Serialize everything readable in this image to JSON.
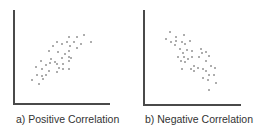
{
  "chart_data": [
    {
      "type": "scatter",
      "title": "a) Positive Correlation",
      "xlabel": "",
      "ylabel": "",
      "grid": false,
      "legend": "none",
      "note": "pixel coordinates within panel (x right, y down); no axis ticks or labels shown",
      "axes": {
        "origin": [
          14,
          104
        ],
        "y_top": 10,
        "x_end": 110
      },
      "points": [
        [
          69,
          37
        ],
        [
          77,
          37
        ],
        [
          84,
          35
        ],
        [
          57,
          42
        ],
        [
          62,
          44
        ],
        [
          67,
          42
        ],
        [
          74,
          42
        ],
        [
          81,
          44
        ],
        [
          91,
          42
        ],
        [
          53,
          46
        ],
        [
          70,
          46
        ],
        [
          77,
          48
        ],
        [
          49,
          51
        ],
        [
          58,
          52
        ],
        [
          69,
          51
        ],
        [
          65,
          54
        ],
        [
          69,
          57
        ],
        [
          71,
          58
        ],
        [
          41,
          61
        ],
        [
          51,
          59
        ],
        [
          55,
          62
        ],
        [
          62,
          58
        ],
        [
          69,
          61
        ],
        [
          36,
          67
        ],
        [
          46,
          65
        ],
        [
          50,
          63
        ],
        [
          57,
          64
        ],
        [
          63,
          64
        ],
        [
          42,
          69
        ],
        [
          49,
          71
        ],
        [
          59,
          68
        ],
        [
          63,
          69
        ],
        [
          69,
          69
        ],
        [
          37,
          75
        ],
        [
          42,
          76
        ],
        [
          46,
          75
        ],
        [
          57,
          72
        ],
        [
          32,
          80
        ],
        [
          43,
          79
        ],
        [
          39,
          84
        ]
      ]
    },
    {
      "type": "scatter",
      "title": "b) Negative Correlation",
      "xlabel": "",
      "ylabel": "",
      "grid": false,
      "legend": "none",
      "note": "pixel coordinates within panel (x right, y down); no axis ticks or labels shown",
      "axes": {
        "origin": [
          11,
          105
        ],
        "y_top": 10,
        "x_end": 108
      },
      "points": [
        [
          37,
          32
        ],
        [
          51,
          35
        ],
        [
          43,
          37
        ],
        [
          33,
          39
        ],
        [
          38,
          42
        ],
        [
          43,
          41
        ],
        [
          49,
          42
        ],
        [
          57,
          41
        ],
        [
          42,
          45
        ],
        [
          52,
          44
        ],
        [
          47,
          49
        ],
        [
          54,
          50
        ],
        [
          59,
          51
        ],
        [
          68,
          49
        ],
        [
          73,
          52
        ],
        [
          50,
          53
        ],
        [
          69,
          53
        ],
        [
          45,
          57
        ],
        [
          51,
          57
        ],
        [
          59,
          57
        ],
        [
          66,
          57
        ],
        [
          76,
          56
        ],
        [
          48,
          61
        ],
        [
          52,
          62
        ],
        [
          55,
          59
        ],
        [
          73,
          61
        ],
        [
          61,
          66
        ],
        [
          78,
          66
        ],
        [
          49,
          69
        ],
        [
          58,
          69
        ],
        [
          65,
          68
        ],
        [
          70,
          69
        ],
        [
          82,
          68
        ],
        [
          61,
          71
        ],
        [
          73,
          71
        ],
        [
          76,
          75
        ],
        [
          81,
          75
        ],
        [
          70,
          78
        ],
        [
          75,
          80
        ],
        [
          83,
          83
        ],
        [
          76,
          90
        ]
      ]
    }
  ],
  "colors": {
    "axis": "#4a4a4a",
    "point": "#8a8a8a",
    "caption": "#333333"
  }
}
